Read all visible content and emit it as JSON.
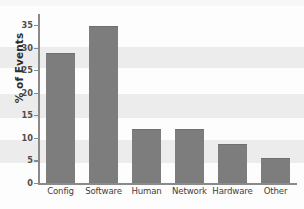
{
  "chart_data": {
    "type": "bar",
    "title": "",
    "subtitle": "",
    "xlabel": "",
    "ylabel": "% of Events",
    "categories": [
      "Config",
      "Software",
      "Human",
      "Network",
      "Hardware",
      "Other"
    ],
    "values": [
      28.5,
      34.5,
      11.7,
      11.7,
      8.4,
      5.3
    ],
    "ylim": [
      0,
      37
    ],
    "yticks": [
      0,
      5,
      10,
      15,
      20,
      25,
      30,
      35
    ],
    "ytick_labels": [
      "0",
      "5",
      "10",
      "15",
      "20",
      "25",
      "30",
      "35"
    ],
    "grid": false,
    "legend": null,
    "legend_position": "none",
    "bar_color": "#7d7d7d",
    "axis_color": "#8a8a8a",
    "background_color": "#ffffff"
  }
}
